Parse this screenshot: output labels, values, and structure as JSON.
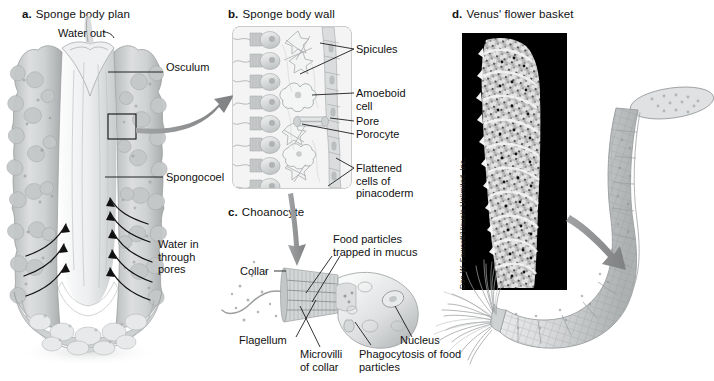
{
  "figure": {
    "background_color": "#ffffff",
    "ink_color": "#111111",
    "arrow_color": "#8d8d8d",
    "sponge_fill": "#d8dadb",
    "sponge_shade": "#a9acad",
    "panel_box_fill": "#f2f2f2",
    "panel_box_border": "#9a9a9a",
    "photo_background": "#000000"
  },
  "panels": [
    {
      "key": "a",
      "letter": "a.",
      "title": "Sponge body plan",
      "title_x": 22,
      "title_y": 8,
      "labels": [
        {
          "name": "water-out",
          "text": "Water out",
          "x": 58,
          "y": 27
        },
        {
          "name": "osculum",
          "text": "Osculum",
          "x": 166,
          "y": 67
        },
        {
          "name": "spongocoel",
          "text": "Spongocoel",
          "x": 166,
          "y": 172
        },
        {
          "name": "water-in-through-pores",
          "text": "Water in\nthrough\npores",
          "x": 158,
          "y": 243
        }
      ]
    },
    {
      "key": "b",
      "letter": "b.",
      "title": "Sponge body wall",
      "title_x": 228,
      "title_y": 8,
      "labels": [
        {
          "name": "spicules",
          "text": "Spicules",
          "x": 355,
          "y": 44
        },
        {
          "name": "amoeboid-cell",
          "text": "Amoeboid\ncell",
          "x": 355,
          "y": 88
        },
        {
          "name": "pore",
          "text": "Pore",
          "x": 355,
          "y": 119
        },
        {
          "name": "porocyte",
          "text": "Porocyte",
          "x": 355,
          "y": 132
        },
        {
          "name": "flattened-cells-of-pinacoderm",
          "text": "Flattened\ncells of\npinacoderm",
          "x": 355,
          "y": 163
        }
      ]
    },
    {
      "key": "c",
      "letter": "c.",
      "title": "Choanocyte",
      "title_x": 228,
      "title_y": 206,
      "labels": [
        {
          "name": "food-particles-trapped-in-mucus",
          "text": "Food particles\ntrapped in mucus",
          "x": 333,
          "y": 238
        },
        {
          "name": "collar",
          "text": "Collar",
          "x": 243,
          "y": 268
        },
        {
          "name": "flagellum",
          "text": "Flagellum",
          "x": 264,
          "y": 340
        },
        {
          "name": "microvilli-of-collar",
          "text": "Microvilli\nof collar",
          "x": 302,
          "y": 352
        },
        {
          "name": "phagocytosis-of-food-particles",
          "text": "Phagocytosis of food\nparticles",
          "x": 356,
          "y": 352
        },
        {
          "name": "nucleus",
          "text": "Nucleus",
          "x": 403,
          "y": 340
        }
      ]
    },
    {
      "key": "d",
      "letter": "d.",
      "title": "Venus' flower basket",
      "title_x": 452,
      "title_y": 8,
      "labels": [],
      "photo_credit": "Don W. Fawcett/Visuals Unlimited, Inc."
    }
  ]
}
